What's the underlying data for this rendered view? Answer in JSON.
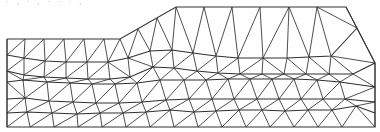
{
  "figure": {
    "title": "",
    "stroke_color": "#333333",
    "background": "#ffffff",
    "cropped_text_top": "· , · , · · · ,",
    "cropped_text_bottom": "· ·"
  },
  "mesh": {
    "boundary": [
      [
        7,
        39
      ],
      [
        120,
        39
      ],
      [
        176,
        7
      ],
      [
        346,
        7
      ],
      [
        375,
        63
      ],
      [
        375,
        127
      ],
      [
        7,
        127
      ],
      [
        7,
        39
      ]
    ],
    "rows": [
      [
        [
          7,
          39
        ],
        [
          25,
          39
        ],
        [
          44,
          39
        ],
        [
          64,
          39
        ],
        [
          84,
          39
        ],
        [
          104,
          39
        ],
        [
          120,
          39
        ],
        [
          138,
          29
        ],
        [
          157,
          18
        ],
        [
          176,
          7
        ],
        [
          204,
          7
        ],
        [
          232,
          7
        ],
        [
          260,
          7
        ],
        [
          289,
          7
        ],
        [
          317,
          7
        ],
        [
          346,
          7
        ]
      ],
      [
        [
          7,
          55
        ],
        [
          24,
          58
        ],
        [
          45,
          61
        ],
        [
          66,
          62
        ],
        [
          87,
          62
        ],
        [
          108,
          62
        ],
        [
          128,
          58
        ],
        [
          150,
          51
        ],
        [
          172,
          50
        ],
        [
          193,
          53
        ],
        [
          216,
          56
        ],
        [
          238,
          58
        ],
        [
          263,
          58
        ],
        [
          287,
          58
        ],
        [
          309,
          57
        ],
        [
          331,
          56
        ],
        [
          357,
          28
        ]
      ],
      [
        [
          7,
          71
        ],
        [
          24,
          75
        ],
        [
          44,
          77
        ],
        [
          66,
          78
        ],
        [
          88,
          79
        ],
        [
          110,
          79
        ],
        [
          130,
          77
        ],
        [
          153,
          67
        ],
        [
          174,
          68
        ],
        [
          197,
          71
        ],
        [
          218,
          73
        ],
        [
          240,
          74
        ],
        [
          262,
          74
        ],
        [
          284,
          74
        ],
        [
          306,
          74
        ],
        [
          329,
          74
        ],
        [
          353,
          74
        ],
        [
          375,
          63
        ]
      ],
      [
        [
          7,
          82
        ],
        [
          23,
          80
        ],
        [
          47,
          82
        ],
        [
          70,
          83
        ],
        [
          92,
          84
        ],
        [
          115,
          84
        ],
        [
          137,
          83
        ],
        [
          160,
          80
        ],
        [
          184,
          80
        ],
        [
          206,
          80
        ],
        [
          228,
          79
        ],
        [
          250,
          79
        ],
        [
          272,
          79
        ],
        [
          294,
          79
        ],
        [
          317,
          80
        ],
        [
          340,
          82
        ],
        [
          375,
          87
        ]
      ],
      [
        [
          7,
          99
        ],
        [
          25,
          98
        ],
        [
          49,
          101
        ],
        [
          73,
          102
        ],
        [
          96,
          103
        ],
        [
          119,
          103
        ],
        [
          142,
          102
        ],
        [
          166,
          100
        ],
        [
          189,
          99
        ],
        [
          212,
          99
        ],
        [
          234,
          99
        ],
        [
          257,
          99
        ],
        [
          279,
          99
        ],
        [
          301,
          99
        ],
        [
          323,
          99
        ],
        [
          345,
          99
        ],
        [
          375,
          102
        ]
      ],
      [
        [
          7,
          113
        ],
        [
          27,
          112
        ],
        [
          52,
          113
        ],
        [
          77,
          114
        ],
        [
          100,
          113
        ],
        [
          123,
          113
        ],
        [
          146,
          112
        ],
        [
          170,
          110
        ],
        [
          194,
          112
        ],
        [
          216,
          111
        ],
        [
          239,
          110
        ],
        [
          262,
          110
        ],
        [
          285,
          111
        ],
        [
          308,
          110
        ],
        [
          332,
          110
        ],
        [
          356,
          106
        ],
        [
          375,
          113
        ]
      ],
      [
        [
          7,
          127
        ],
        [
          30,
          127
        ],
        [
          54,
          127
        ],
        [
          78,
          127
        ],
        [
          102,
          127
        ],
        [
          126,
          127
        ],
        [
          150,
          127
        ],
        [
          174,
          127
        ],
        [
          198,
          127
        ],
        [
          222,
          127
        ],
        [
          246,
          127
        ],
        [
          270,
          127
        ],
        [
          294,
          127
        ],
        [
          318,
          127
        ],
        [
          342,
          127
        ],
        [
          375,
          127
        ]
      ]
    ]
  }
}
